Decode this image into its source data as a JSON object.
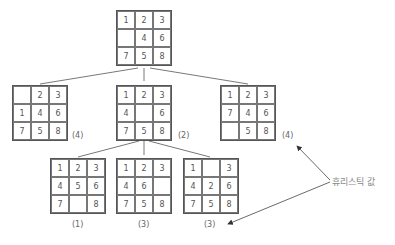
{
  "diagram": {
    "annotation_label": "휴리스틱 값",
    "root": {
      "cells": [
        "1",
        "2",
        "3",
        "",
        "4",
        "6",
        "7",
        "5",
        "8"
      ]
    },
    "level1": [
      {
        "cells": [
          "",
          "2",
          "3",
          "1",
          "4",
          "6",
          "7",
          "5",
          "8"
        ],
        "h": "(4)"
      },
      {
        "cells": [
          "1",
          "2",
          "3",
          "4",
          "",
          "6",
          "7",
          "5",
          "8"
        ],
        "h": "(2)"
      },
      {
        "cells": [
          "1",
          "2",
          "3",
          "7",
          "4",
          "6",
          "",
          "5",
          "8"
        ],
        "h": "(4)"
      }
    ],
    "level2": [
      {
        "cells": [
          "1",
          "2",
          "3",
          "4",
          "5",
          "6",
          "7",
          "",
          "8"
        ],
        "h": "(1)"
      },
      {
        "cells": [
          "1",
          "2",
          "3",
          "4",
          "6",
          "",
          "7",
          "5",
          "8"
        ],
        "h": "(3)"
      },
      {
        "cells": [
          "1",
          "",
          "3",
          "4",
          "2",
          "6",
          "7",
          "5",
          "8"
        ],
        "h": "(3)"
      }
    ],
    "colors": {
      "grid_border": "#555555",
      "text": "#555555",
      "annotation": "#888888",
      "lines": "#555555"
    }
  }
}
